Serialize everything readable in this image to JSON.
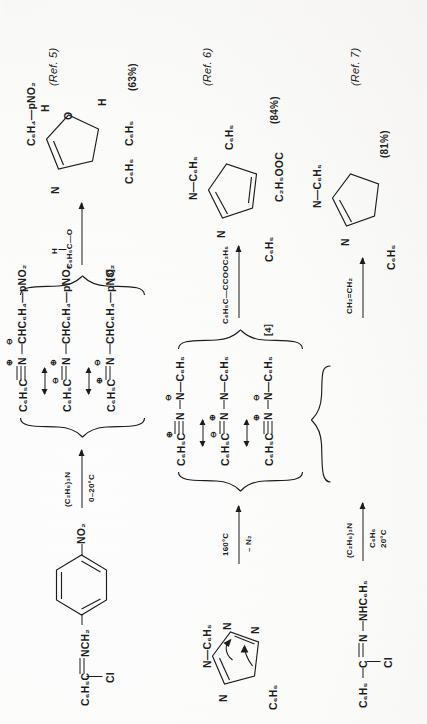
{
  "page": {
    "orientation": "rotated-90-ccw",
    "kind": "chemistry-reaction-schemes",
    "ink_color": "#1c1c1c",
    "paper_color": "#fdfdfc"
  },
  "schemes": [
    {
      "id": "scheme-5",
      "reactant": {
        "formula_parts": [
          "C",
          "6",
          "H",
          "5",
          "C",
          "Cl",
          "N",
          "CH",
          "2"
        ],
        "text": "C6H5C(Cl)=NCH2—C6H4—NO2",
        "left_label": "C₆H₅C",
        "cl_label": "Cl",
        "link_label": "NCH₂",
        "ring_substituent": "NO₂"
      },
      "conditions": {
        "above": "(C₂H₅)₃N",
        "below": "0–20°C"
      },
      "intermediate": {
        "bracket_label": "[3]",
        "resonance": [
          {
            "left": "C₆H₅C",
            "bond": "triple",
            "center": "N",
            "center_charge": "⊕",
            "right": "CHC₆H₄—pNO₂",
            "right_charge": "⊖"
          },
          {
            "left": "C₆H₅C",
            "bond": "double",
            "center": "N",
            "center_charge": "⊕",
            "right": "CHC₆H₄—pNO₂",
            "left_charge": "⊖"
          },
          {
            "left": "C₆H₅C",
            "bond": "double",
            "center": "N",
            "center_charge": "⊖",
            "right": "CHC₆H₄—pNO₂",
            "left_charge": "⊕"
          }
        ]
      },
      "reagent": {
        "above_line1": "H",
        "above_line2": "C₆H₅C—O"
      },
      "product": {
        "ring": "oxazoline",
        "labels": [
          "C₆H₄—pNO₂",
          "H",
          "N",
          "O",
          "H",
          "C₆H₅",
          "C₆H₅"
        ]
      },
      "yield": "(63%)",
      "reference": "(Ref. 5)"
    },
    {
      "id": "scheme-6",
      "reactant": {
        "ring": "tetrazole",
        "labels": [
          "N—C₆H₅",
          "N",
          "N",
          "N",
          "C₆H₅"
        ],
        "arrows": "electron-pushing"
      },
      "conditions": {
        "above": "160°C",
        "below": "– N₂"
      },
      "intermediate": {
        "bracket_label": "[4]",
        "resonance": [
          {
            "left": "C₆H₅C",
            "left_charge": "⊕",
            "center": "N",
            "right": "N—C₆H₅",
            "right_charge": "⊖"
          },
          {
            "left": "C₆H₅C",
            "left_charge": "⊖",
            "center": "N",
            "center_charge": "⊕",
            "right": "N—C₆H₅"
          },
          {
            "left": "C₆H₅C",
            "center": "N",
            "center_charge": "⊕",
            "right": "N—C₆H₅",
            "right_charge": "⊖"
          }
        ]
      },
      "reagent": {
        "above_line1": "",
        "above_line2": "C₆H₅C—CCOOC₂H₅"
      },
      "product": {
        "ring": "pyrazole",
        "labels": [
          "N—C₆H₅",
          "C₆H₅",
          "N",
          "C₂H₅OOC",
          "C₆H₅"
        ]
      },
      "yield": "(84%)",
      "reference": "(Ref. 6)"
    },
    {
      "id": "scheme-7",
      "reactant": {
        "text": "C6H5C(Cl)=N—NHC6H5",
        "left_label": "C₆H₅",
        "c_label": "C",
        "cl_label": "Cl",
        "n_label": "N",
        "right_label": "NHC₆H₅"
      },
      "conditions": {
        "above": "(C₂H₅)₃N",
        "below_line1": "C₆H₆",
        "below_line2": "20°C"
      },
      "reagent": {
        "above_line2": "CH₂=CH₂"
      },
      "product": {
        "ring": "pyrazoline",
        "labels": [
          "N—C₆H₅",
          "N",
          "C₆H₅"
        ]
      },
      "yield": "(81%)",
      "reference": "(Ref. 7)"
    }
  ]
}
